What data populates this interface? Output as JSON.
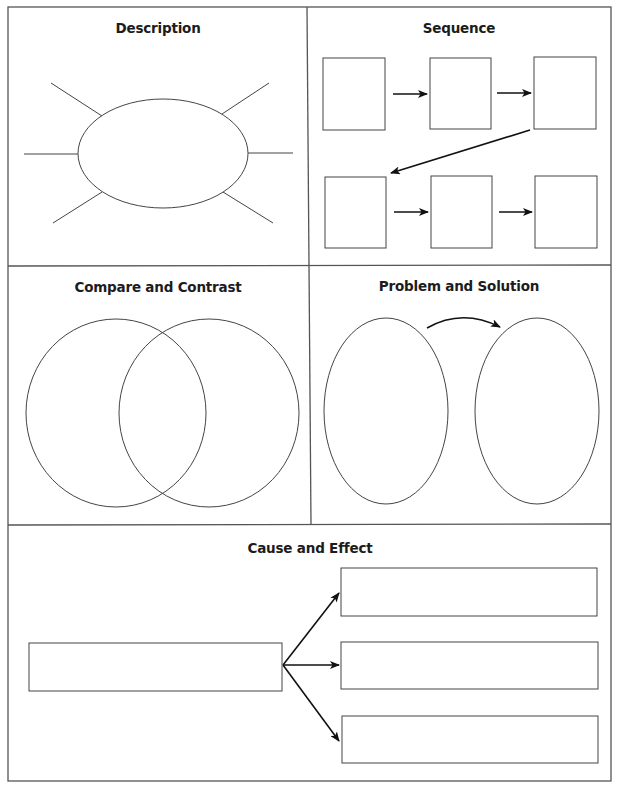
{
  "page": {
    "type": "graphic-organizer-worksheet",
    "colors": {
      "line": "#444444",
      "frame": "#555555",
      "arrow": "#111111",
      "background": "#ffffff",
      "text": "#1c1c1c"
    }
  },
  "sections": {
    "description": {
      "title": "Description",
      "shape": "ellipse-with-6-spokes",
      "spoke_count": 6
    },
    "sequence": {
      "title": "Sequence",
      "shape": "six-boxes-two-rows-with-arrows",
      "box_count": 6,
      "rows": 2
    },
    "compare_contrast": {
      "title": "Compare and Contrast",
      "shape": "venn-diagram-two-circles",
      "circle_count": 2
    },
    "problem_solution": {
      "title": "Problem and Solution",
      "shape": "two-ovals-with-curved-arrow",
      "oval_count": 2
    },
    "cause_effect": {
      "title": "Cause and Effect",
      "shape": "one-box-branching-to-three-boxes",
      "cause_count": 1,
      "effect_count": 3
    }
  }
}
